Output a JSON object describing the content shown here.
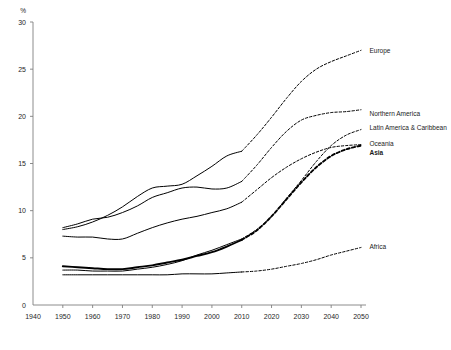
{
  "chart_data": {
    "type": "line",
    "title": "",
    "subtitle": "",
    "xlabel": "",
    "ylabel": "%",
    "unit_label": "%",
    "xlim": [
      1940,
      2050
    ],
    "ylim": [
      0,
      30
    ],
    "xticks": [
      "1940",
      "1950",
      "1960",
      "1970",
      "1980",
      "1990",
      "2000",
      "2010",
      "2020",
      "2030",
      "2040",
      "2050"
    ],
    "yticks": [
      "0",
      "5",
      "10",
      "15",
      "20",
      "25",
      "30"
    ],
    "grid": false,
    "legend_position": "right-inline-labels",
    "projection_start_year": 2010,
    "note": "Solid segments are observed (1950-2010); dashed segments are projections (2010-2050).",
    "x": [
      1950,
      1955,
      1960,
      1965,
      1970,
      1975,
      1980,
      1985,
      1990,
      1995,
      2000,
      2005,
      2010,
      2015,
      2020,
      2025,
      2030,
      2035,
      2040,
      2045,
      2050
    ],
    "series": [
      {
        "name": "Europe",
        "label": "Europe",
        "bold": false,
        "color": "#000000",
        "label_x": 2052,
        "label_y": 27.0,
        "values": [
          8.0,
          8.3,
          8.8,
          9.5,
          10.4,
          11.5,
          12.4,
          12.6,
          12.8,
          13.7,
          14.7,
          15.8,
          16.3,
          18.0,
          19.9,
          21.9,
          23.7,
          25.0,
          25.8,
          26.4,
          27.0
        ]
      },
      {
        "name": "Northern America",
        "label": "Northern America",
        "bold": false,
        "color": "#000000",
        "label_x": 2052,
        "label_y": 20.3,
        "values": [
          8.2,
          8.6,
          9.1,
          9.3,
          9.8,
          10.5,
          11.4,
          11.9,
          12.4,
          12.5,
          12.3,
          12.4,
          13.1,
          14.8,
          16.7,
          18.4,
          19.6,
          20.1,
          20.4,
          20.5,
          20.7
        ]
      },
      {
        "name": "Latin America & Caribbean",
        "label": "Latin America & Caribbean",
        "bold": false,
        "color": "#000000",
        "label_x": 2052,
        "label_y": 18.8,
        "values": [
          3.7,
          3.7,
          3.6,
          3.6,
          3.6,
          3.8,
          4.0,
          4.3,
          4.7,
          5.3,
          5.8,
          6.4,
          7.0,
          8.0,
          9.4,
          11.3,
          13.2,
          15.2,
          16.9,
          18.0,
          18.6
        ]
      },
      {
        "name": "Oceania",
        "label": "Oceania",
        "bold": false,
        "color": "#000000",
        "label_x": 2052,
        "label_y": 17.1,
        "values": [
          7.3,
          7.2,
          7.2,
          7.0,
          7.0,
          7.6,
          8.2,
          8.7,
          9.1,
          9.4,
          9.8,
          10.2,
          10.9,
          12.2,
          13.5,
          14.6,
          15.5,
          16.2,
          16.7,
          16.9,
          17.0
        ]
      },
      {
        "name": "Asia",
        "label": "Asia",
        "bold": true,
        "color": "#000000",
        "label_x": 2052,
        "label_y": 16.2,
        "values": [
          4.1,
          4.0,
          3.9,
          3.8,
          3.8,
          4.0,
          4.2,
          4.5,
          4.8,
          5.2,
          5.6,
          6.2,
          6.9,
          7.9,
          9.4,
          11.2,
          13.0,
          14.6,
          15.8,
          16.5,
          16.9
        ]
      },
      {
        "name": "Africa",
        "label": "Africa",
        "bold": false,
        "color": "#000000",
        "label_x": 2052,
        "label_y": 6.2,
        "values": [
          3.2,
          3.2,
          3.2,
          3.2,
          3.2,
          3.2,
          3.2,
          3.2,
          3.3,
          3.3,
          3.3,
          3.4,
          3.5,
          3.6,
          3.8,
          4.1,
          4.4,
          4.8,
          5.3,
          5.7,
          6.1
        ]
      }
    ]
  }
}
